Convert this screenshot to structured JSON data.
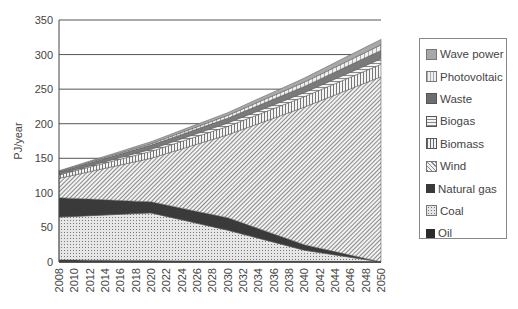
{
  "chart_data": {
    "type": "area",
    "stacked": true,
    "title": "",
    "xlabel": "",
    "ylabel": "PJ/year",
    "ylim": [
      0,
      350
    ],
    "yticks": [
      0,
      50,
      100,
      150,
      200,
      250,
      300,
      350
    ],
    "grid": "horizontal",
    "legend_position": "right",
    "x": [
      2008,
      2010,
      2012,
      2014,
      2016,
      2018,
      2020,
      2022,
      2024,
      2026,
      2028,
      2030,
      2032,
      2034,
      2036,
      2038,
      2040,
      2042,
      2044,
      2046,
      2048,
      2050
    ],
    "key_years": [
      2008,
      2020,
      2030,
      2040,
      2050
    ],
    "series": [
      {
        "name": "Oil",
        "key_values": [
          3,
          2,
          1,
          1,
          0
        ]
      },
      {
        "name": "Coal",
        "key_values": [
          62,
          69,
          45,
          16,
          0
        ]
      },
      {
        "name": "Natural gas",
        "key_values": [
          28,
          16,
          18,
          8,
          0
        ]
      },
      {
        "name": "Wind",
        "key_values": [
          28,
          63,
          120,
          199,
          268
        ]
      },
      {
        "name": "Biomass",
        "key_values": [
          5,
          10,
          12,
          15,
          18
        ]
      },
      {
        "name": "Biogas",
        "key_values": [
          1,
          3,
          5,
          6,
          8
        ]
      },
      {
        "name": "Waste",
        "key_values": [
          3,
          6,
          7,
          9,
          12
        ]
      },
      {
        "name": "Photovoltaic",
        "key_values": [
          1,
          2,
          4,
          6,
          8
        ]
      },
      {
        "name": "Wave power",
        "key_values": [
          1,
          3,
          4,
          6,
          8
        ]
      }
    ]
  },
  "legend": {
    "items": [
      {
        "label": "Wave power"
      },
      {
        "label": "Photovoltaic"
      },
      {
        "label": "Waste"
      },
      {
        "label": "Biogas"
      },
      {
        "label": "Biomass"
      },
      {
        "label": "Wind"
      },
      {
        "label": "Natural gas"
      },
      {
        "label": "Coal"
      },
      {
        "label": "Oil"
      }
    ]
  }
}
